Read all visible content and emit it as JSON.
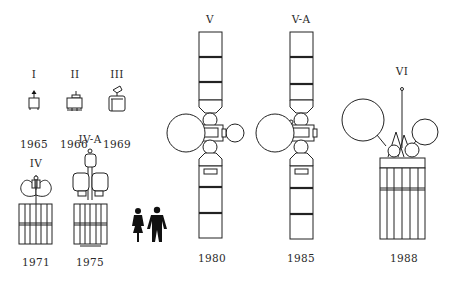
{
  "figure": {
    "generations": [
      {
        "id": "I",
        "label": "I",
        "year": "1965"
      },
      {
        "id": "II",
        "label": "II",
        "year": "1966"
      },
      {
        "id": "III",
        "label": "III",
        "year": "1969"
      },
      {
        "id": "IV",
        "label": "IV",
        "year": "1971"
      },
      {
        "id": "IV-A",
        "label": "IV-A",
        "year": "1975"
      },
      {
        "id": "V",
        "label": "V",
        "year": "1980"
      },
      {
        "id": "V-A",
        "label": "V-A",
        "year": "1985"
      },
      {
        "id": "VI",
        "label": "VI",
        "year": "1988"
      }
    ],
    "scale_reference": "human-figures-woman-and-man"
  }
}
